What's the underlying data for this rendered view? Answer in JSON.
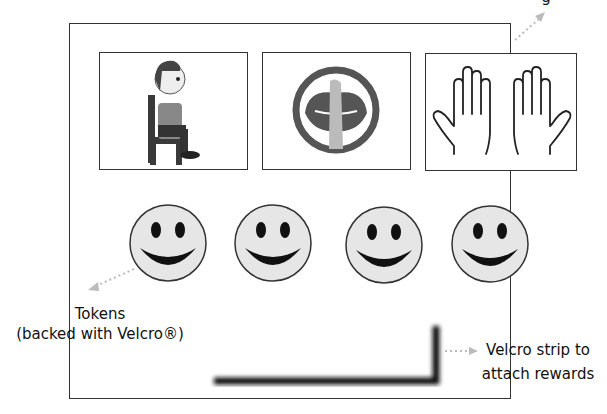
{
  "board": {
    "cards": [
      {
        "name": "sit-card",
        "icon": "child-sitting-on-chair-icon"
      },
      {
        "name": "quiet-card",
        "icon": "finger-on-lips-quiet-icon"
      },
      {
        "name": "hands-card",
        "icon": "open-hands-icon"
      }
    ],
    "tokens": [
      {
        "icon": "smiley-face-icon"
      },
      {
        "icon": "smiley-face-icon"
      },
      {
        "icon": "smiley-face-icon"
      },
      {
        "icon": "smiley-face-icon"
      }
    ]
  },
  "annotations": {
    "top_right_partial": "g",
    "tokens_line1": "Tokens",
    "tokens_line2": "(backed with Velcro®)",
    "velcro_line1": "Velcro strip to",
    "velcro_line2": "attach rewards"
  },
  "colors": {
    "border": "#333333",
    "token_fill": "#e6e6e6",
    "arrow": "#bbbbbb"
  }
}
